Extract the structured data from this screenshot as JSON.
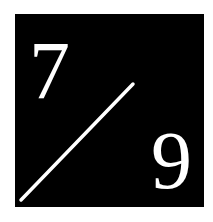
{
  "logo": {
    "numerator": "7",
    "denominator": "9",
    "background_color": "#000000",
    "foreground_color": "#ffffff"
  }
}
